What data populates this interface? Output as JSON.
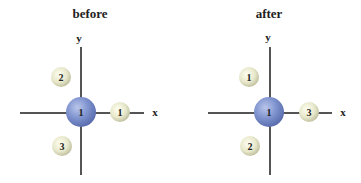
{
  "panels": [
    {
      "title": "before",
      "x_label": "x",
      "y_label": "y",
      "center_label": "1",
      "balls": [
        {
          "label": "1",
          "position": "right on x-axis"
        },
        {
          "label": "2",
          "position": "upper left"
        },
        {
          "label": "3",
          "position": "lower left"
        }
      ]
    },
    {
      "title": "after",
      "x_label": "x",
      "y_label": "y",
      "center_label": "1",
      "balls": [
        {
          "label": "1",
          "position": "upper left"
        },
        {
          "label": "2",
          "position": "lower left"
        },
        {
          "label": "3",
          "position": "right on x-axis"
        }
      ]
    }
  ],
  "colors": {
    "center_sphere": "#6f82c2",
    "ball": "#e6e6c8",
    "axis": "#555555"
  }
}
